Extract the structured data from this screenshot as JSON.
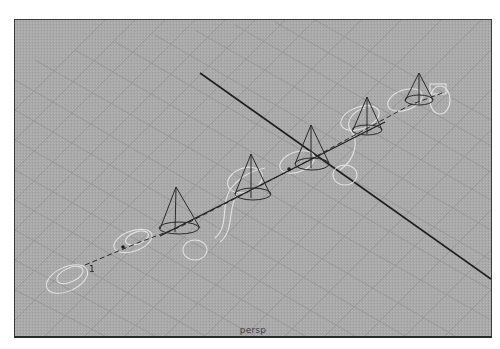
{
  "viewport": {
    "camera_label": "persp",
    "background_color": "#a9a9a9",
    "grid_color": "#8f8f8f",
    "axis_color": "#1f1f1f",
    "cone_color": "#2a2a2a",
    "ghost_color": "#e6e6e6"
  },
  "scene": {
    "objects": [
      {
        "type": "cone",
        "name": "cone-1"
      },
      {
        "type": "cone",
        "name": "cone-2"
      },
      {
        "type": "cone",
        "name": "cone-3"
      },
      {
        "type": "cone",
        "name": "cone-4"
      },
      {
        "type": "cone",
        "name": "cone-5"
      }
    ],
    "motion_path_label": "1"
  }
}
